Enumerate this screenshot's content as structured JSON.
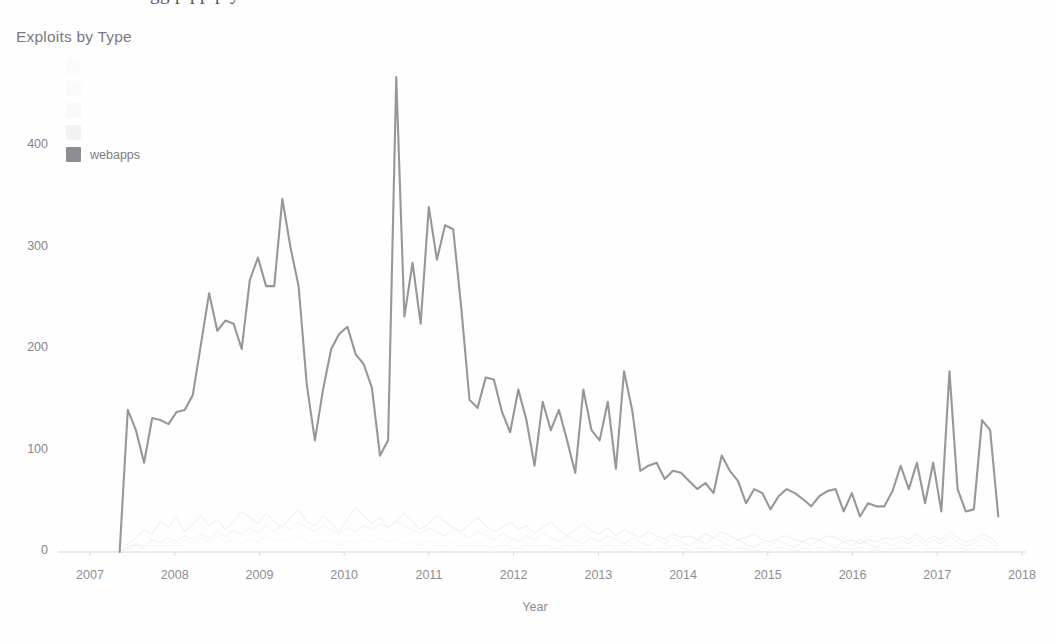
{
  "page": {
    "bleed_text_above": "gg p pp p y"
  },
  "chart": {
    "title": "Exploits by Type",
    "xlabel": "Year",
    "ylabel": ""
  },
  "legend": {
    "position": "top-left-inside",
    "items": [
      {
        "label": "",
        "color": "#fbfbfc",
        "visible_label": false
      },
      {
        "label": "",
        "color": "#fafafb",
        "visible_label": false
      },
      {
        "label": "",
        "color": "#f8f8f9",
        "visible_label": false
      },
      {
        "label": "",
        "color": "#f2f2f4",
        "visible_label": false
      },
      {
        "label": "webapps",
        "color": "#8e8e92",
        "visible_label": true
      }
    ]
  },
  "chart_data": {
    "type": "line",
    "title": "Exploits by Type",
    "xlabel": "Year",
    "ylabel": "",
    "xlim": [
      2007,
      2018
    ],
    "ylim": [
      0,
      470
    ],
    "xticks": [
      "2007",
      "2008",
      "2009",
      "2010",
      "2011",
      "2012",
      "2013",
      "2014",
      "2015",
      "2016",
      "2017",
      "2018"
    ],
    "yticks": [
      0,
      100,
      200,
      300,
      400
    ],
    "grid": false,
    "legend_position": "upper left",
    "x_start": 2007.35,
    "x_end": 2017.72,
    "series": [
      {
        "name": "webapps",
        "color": "#8e8e92",
        "values": [
          0,
          140,
          120,
          88,
          132,
          130,
          126,
          138,
          140,
          155,
          205,
          255,
          218,
          228,
          225,
          200,
          268,
          290,
          262,
          262,
          348,
          300,
          262,
          165,
          110,
          160,
          200,
          215,
          222,
          195,
          185,
          162,
          95,
          110,
          468,
          232,
          285,
          225,
          340,
          288,
          322,
          318,
          240,
          150,
          142,
          172,
          170,
          138,
          118,
          160,
          130,
          85,
          148,
          120,
          140,
          110,
          78,
          160,
          120,
          110,
          148,
          82,
          178,
          140,
          80,
          85,
          88,
          72,
          80,
          78,
          70,
          62,
          68,
          58,
          95,
          80,
          70,
          48,
          62,
          58,
          42,
          55,
          62,
          58,
          52,
          45,
          55,
          60,
          62,
          40,
          58,
          35,
          48,
          45,
          45,
          60,
          85,
          62,
          88,
          48,
          88,
          40,
          178,
          62,
          40,
          42,
          130,
          120,
          35
        ]
      },
      {
        "name": "faint-series-a",
        "color": "#e9e9ec",
        "values": [
          0,
          8,
          14,
          22,
          18,
          30,
          24,
          34,
          20,
          28,
          36,
          26,
          32,
          22,
          30,
          40,
          34,
          28,
          38,
          30,
          24,
          34,
          42,
          30,
          26,
          36,
          28,
          20,
          32,
          44,
          36,
          28,
          34,
          24,
          30,
          38,
          30,
          22,
          28,
          36,
          30,
          24,
          20,
          28,
          34,
          26,
          20,
          24,
          30,
          22,
          26,
          18,
          24,
          30,
          22,
          16,
          22,
          28,
          20,
          18,
          24,
          16,
          22,
          18,
          14,
          20,
          16,
          12,
          18,
          14,
          16,
          12,
          18,
          14,
          20,
          16,
          12,
          14,
          18,
          12,
          10,
          14,
          16,
          12,
          10,
          14,
          12,
          16,
          14,
          10,
          12,
          8,
          12,
          10,
          14,
          12,
          16,
          12,
          18,
          10,
          16,
          12,
          20,
          14,
          10,
          12,
          18,
          14,
          8
        ]
      },
      {
        "name": "faint-series-b",
        "color": "#f0eef1",
        "values": [
          0,
          4,
          8,
          6,
          12,
          9,
          14,
          10,
          16,
          12,
          18,
          14,
          20,
          15,
          22,
          17,
          24,
          19,
          26,
          20,
          28,
          22,
          30,
          24,
          20,
          26,
          22,
          18,
          24,
          20,
          26,
          22,
          28,
          24,
          30,
          26,
          22,
          18,
          24,
          20,
          16,
          22,
          18,
          14,
          20,
          16,
          12,
          18,
          14,
          10,
          16,
          12,
          18,
          14,
          10,
          16,
          12,
          8,
          14,
          10,
          16,
          12,
          8,
          14,
          10,
          6,
          12,
          8,
          14,
          10,
          6,
          12,
          8,
          14,
          10,
          6,
          12,
          8,
          4,
          10,
          6,
          12,
          8,
          4,
          10,
          6,
          12,
          8,
          4,
          10,
          6,
          12,
          8,
          4,
          10,
          6,
          12,
          8,
          14,
          6,
          12,
          8,
          16,
          10,
          6,
          8,
          14,
          10,
          4
        ]
      },
      {
        "name": "faint-series-c",
        "color": "#f6f4f7",
        "values": [
          0,
          3,
          6,
          4,
          8,
          5,
          10,
          7,
          12,
          8,
          14,
          9,
          16,
          10,
          12,
          8,
          14,
          10,
          16,
          11,
          13,
          9,
          15,
          10,
          8,
          12,
          9,
          7,
          11,
          8,
          13,
          9,
          14,
          10,
          12,
          8,
          10,
          7,
          11,
          8,
          6,
          10,
          7,
          5,
          9,
          6,
          4,
          8,
          5,
          3,
          7,
          4,
          8,
          5,
          3,
          7,
          4,
          2,
          6,
          3,
          7,
          4,
          2,
          6,
          3,
          2,
          5,
          3,
          6,
          4,
          2,
          5,
          3,
          6,
          4,
          2,
          5,
          3,
          1,
          4,
          2,
          5,
          3,
          1,
          4,
          2,
          5,
          3,
          1,
          4,
          2,
          5,
          3,
          1,
          4,
          2,
          5,
          3,
          6,
          2,
          5,
          3,
          7,
          4,
          2,
          3,
          6,
          4,
          1
        ]
      }
    ]
  }
}
